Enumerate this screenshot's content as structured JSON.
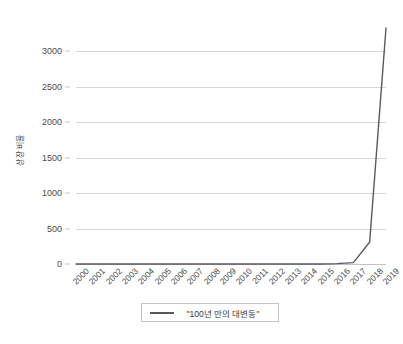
{
  "chart_data": {
    "type": "line",
    "title": "",
    "xlabel": "",
    "ylabel": "상장 비율",
    "categories": [
      "2000",
      "2001",
      "2002",
      "2003",
      "2004",
      "2005",
      "2006",
      "2007",
      "2008",
      "2009",
      "2010",
      "2011",
      "2012",
      "2013",
      "2014",
      "2015",
      "2016",
      "2017",
      "2018",
      "2019"
    ],
    "series": [
      {
        "name": "\"100년 만의 대변동\"",
        "color": "#595959",
        "values": [
          0,
          0,
          0,
          0,
          0,
          0,
          0,
          0,
          0,
          0,
          0,
          0,
          0,
          0,
          0,
          0,
          5,
          20,
          310,
          3330
        ]
      }
    ],
    "y_ticks": [
      0,
      500,
      1000,
      1500,
      2000,
      2500,
      3000
    ],
    "ylim": [
      0,
      3500
    ],
    "grid": true,
    "legend_position": "bottom",
    "legend_entries": [
      "\"100년 만의 대변동\""
    ]
  },
  "axes": {
    "y_title": "상장 비율",
    "y_tick_labels": [
      "3000",
      "2500",
      "2000",
      "1500",
      "1000",
      "500",
      "0"
    ],
    "x_tick_labels": [
      "2000",
      "2001",
      "2002",
      "2003",
      "2004",
      "2005",
      "2006",
      "2007",
      "2008",
      "2009",
      "2010",
      "2011",
      "2012",
      "2013",
      "2014",
      "2015",
      "2016",
      "2017",
      "2018",
      "2019"
    ]
  },
  "legend": {
    "label": "\"100년 만의 대변동\""
  },
  "style": {
    "line_color": "#595959",
    "grid_color": "#d6d6d6",
    "text_color": "#4a4a4a",
    "background": "#ffffff"
  }
}
